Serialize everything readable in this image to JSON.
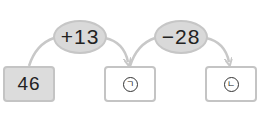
{
  "diagram": {
    "start": {
      "value": "46"
    },
    "operations": [
      {
        "label": "+13"
      },
      {
        "label": "−28"
      }
    ],
    "results": [
      {
        "label": "ㄱ"
      },
      {
        "label": "ㄴ"
      }
    ]
  },
  "colors": {
    "given_box_fill": "#dcdcdc",
    "border": "#c4c4c4",
    "operation_fill": "#d9d9d9",
    "arrow": "#c8c8c8"
  }
}
